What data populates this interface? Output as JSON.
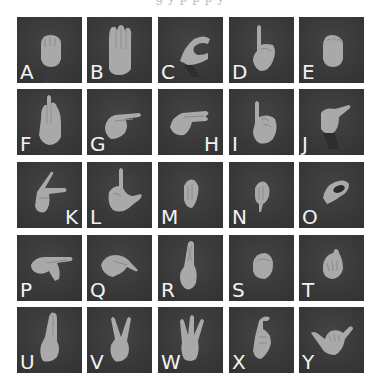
{
  "figure": {
    "caption_top_fragment": "g                    y           p         p            p              y",
    "caption_bottom_fragment": "",
    "colors": {
      "tile_background": "#3b3b3b",
      "hand": "#a9a9a9",
      "label": "#f2f2f2",
      "page": "#ffffff"
    },
    "grid": {
      "rows": 5,
      "cols": 5
    },
    "tiles": [
      {
        "letter": "A",
        "sign": "fist-thumb-side",
        "label_side": "left"
      },
      {
        "letter": "B",
        "sign": "flat-hand-up",
        "label_side": "left"
      },
      {
        "letter": "C",
        "sign": "curved-c",
        "label_side": "left"
      },
      {
        "letter": "D",
        "sign": "index-up",
        "label_side": "left"
      },
      {
        "letter": "E",
        "sign": "curled-fingers",
        "label_side": "left"
      },
      {
        "letter": "F",
        "sign": "three-fingers-up",
        "label_side": "left"
      },
      {
        "letter": "G",
        "sign": "index-point-side",
        "label_side": "left"
      },
      {
        "letter": "H",
        "sign": "two-fingers-side",
        "label_side": "right"
      },
      {
        "letter": "I",
        "sign": "pinky-up",
        "label_side": "left"
      },
      {
        "letter": "J",
        "sign": "pinky-hook",
        "label_side": "left"
      },
      {
        "letter": "K",
        "sign": "index-middle-k",
        "label_side": "right"
      },
      {
        "letter": "L",
        "sign": "l-shape",
        "label_side": "left"
      },
      {
        "letter": "M",
        "sign": "fist-m",
        "label_side": "left"
      },
      {
        "letter": "N",
        "sign": "fist-n",
        "label_side": "left"
      },
      {
        "letter": "O",
        "sign": "o-shape",
        "label_side": "left"
      },
      {
        "letter": "P",
        "sign": "point-down-p",
        "label_side": "left"
      },
      {
        "letter": "Q",
        "sign": "point-down-q",
        "label_side": "left"
      },
      {
        "letter": "R",
        "sign": "crossed-fingers",
        "label_side": "left"
      },
      {
        "letter": "S",
        "sign": "fist-s",
        "label_side": "left"
      },
      {
        "letter": "T",
        "sign": "fist-t",
        "label_side": "left"
      },
      {
        "letter": "U",
        "sign": "two-fingers-up-together",
        "label_side": "left"
      },
      {
        "letter": "V",
        "sign": "v-sign",
        "label_side": "left"
      },
      {
        "letter": "W",
        "sign": "three-fingers-w",
        "label_side": "left"
      },
      {
        "letter": "X",
        "sign": "hooked-index",
        "label_side": "left"
      },
      {
        "letter": "Y",
        "sign": "thumb-pinky-out",
        "label_side": "left"
      }
    ]
  }
}
